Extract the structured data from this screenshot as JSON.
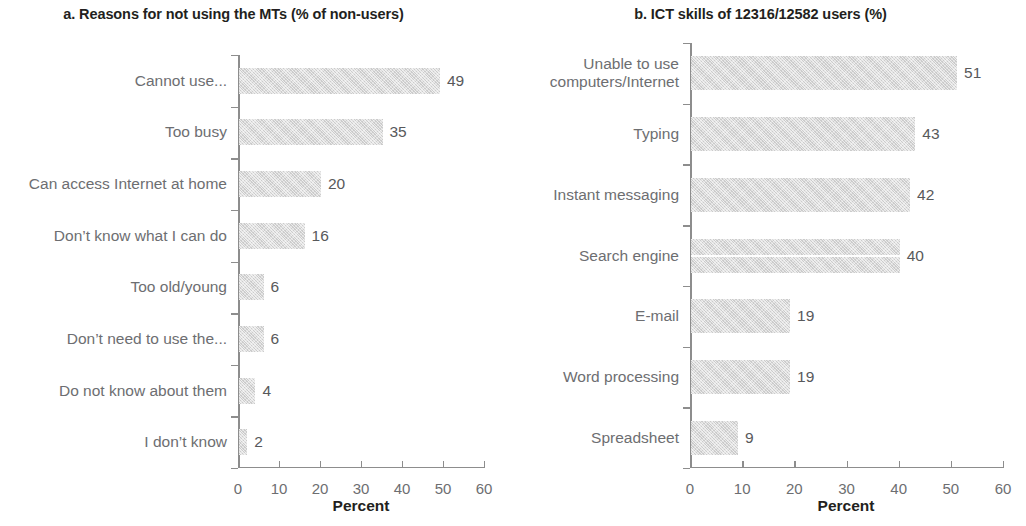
{
  "figure": {
    "panels": [
      {
        "id": "a",
        "title": "a. Reasons for not using the MTs (% of non-users)",
        "axis_title": "Percent"
      },
      {
        "id": "b",
        "title": "b. ICT skills of 12316/12582 users (%)",
        "axis_title": "Percent"
      }
    ]
  },
  "chart_data": [
    {
      "type": "bar",
      "orientation": "horizontal",
      "title": "a. Reasons for not using the MTs (% of non-users)",
      "xlabel": "Percent",
      "ylabel": "",
      "xlim": [
        0,
        60
      ],
      "xticks": [
        0,
        10,
        20,
        30,
        40,
        50,
        60
      ],
      "xticklabels": [
        "0",
        "10",
        "20",
        "30",
        "40",
        "50",
        "60"
      ],
      "grid": false,
      "legend": false,
      "bar_color": "#d4d4d4",
      "categories": [
        "Cannot use...",
        "Too busy",
        "Can access Internet at home",
        "Don’t know what I can do",
        "Too old/young",
        "Don’t need to use the...",
        "Do not know about them",
        "I don’t know"
      ],
      "values": [
        49,
        35,
        20,
        16,
        6,
        6,
        4,
        2
      ],
      "value_labels": [
        "49",
        "35",
        "20",
        "16",
        "6",
        "6",
        "4",
        "2"
      ]
    },
    {
      "type": "bar",
      "orientation": "horizontal",
      "title": "b. ICT skills of 12316/12582 users (%)",
      "xlabel": "Percent",
      "ylabel": "",
      "xlim": [
        0,
        60
      ],
      "xticks": [
        0,
        10,
        20,
        30,
        40,
        50,
        60
      ],
      "xticklabels": [
        "0",
        "10",
        "20",
        "30",
        "40",
        "50",
        "60"
      ],
      "grid": false,
      "legend": false,
      "bar_color": "#d3d3d3",
      "categories": [
        "Unable to use computers/Internet",
        "Typing",
        "Instant messaging",
        "Search engine",
        "E-mail",
        "Word processing",
        "Spreadsheet"
      ],
      "values": [
        51,
        43,
        42,
        40,
        19,
        19,
        9
      ],
      "value_labels": [
        "51",
        "43",
        "42",
        "40",
        "19",
        "19",
        "9"
      ]
    }
  ]
}
